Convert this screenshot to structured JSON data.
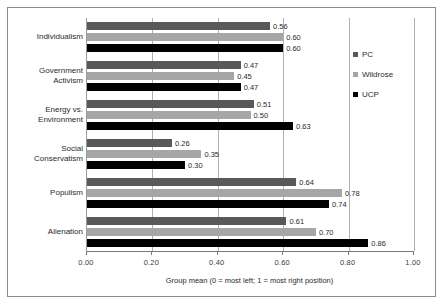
{
  "chart_data": {
    "type": "bar",
    "orientation": "horizontal",
    "title": "",
    "xlabel": "Group mean (0 = most left; 1 = most right position)",
    "ylabel": "",
    "xlim": [
      0,
      1
    ],
    "xticks": [
      "0.00",
      "0.20",
      "0.40",
      "0.60",
      "0.80",
      "1.00"
    ],
    "xtick_values": [
      0,
      0.2,
      0.4,
      0.6,
      0.8,
      1
    ],
    "grid": true,
    "legend_position": "right",
    "categories": [
      "Individualism",
      "Government\nActivism",
      "Energy vs.\nEnvironment",
      "Social\nConservatism",
      "Populism",
      "Alienation"
    ],
    "series": [
      {
        "name": "PC",
        "color": "#595959",
        "values": [
          0.56,
          0.47,
          0.51,
          0.26,
          0.64,
          0.61
        ],
        "labels": [
          "0.56",
          "0.47",
          "0.51",
          "0.26",
          "0.64",
          "0.61"
        ]
      },
      {
        "name": "Wildrose",
        "color": "#a6a6a6",
        "values": [
          0.6,
          0.45,
          0.5,
          0.35,
          0.78,
          0.7
        ],
        "labels": [
          "0.60",
          "0.45",
          "0.50",
          "0.35",
          "0.78",
          "0.70"
        ]
      },
      {
        "name": "UCP",
        "color": "#000000",
        "values": [
          0.6,
          0.47,
          0.63,
          0.3,
          0.74,
          0.86
        ],
        "labels": [
          "0.60",
          "0.47",
          "0.63",
          "0.30",
          "0.74",
          "0.86"
        ]
      }
    ]
  }
}
